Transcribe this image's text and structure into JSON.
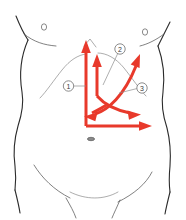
{
  "figure": {
    "background_color": "#ffffff",
    "outline_color": "#2b2b2b",
    "arrow_color": "#e8392b",
    "label_color": "#3a3a3a",
    "width": 186,
    "height": 220
  },
  "callouts": [
    {
      "id": "callout-1",
      "label": "①",
      "number": "1",
      "cx": 68.5,
      "cy": 86,
      "r": 5.2,
      "leader": "M 73.7 86 L 86 86"
    },
    {
      "id": "callout-2",
      "label": "②",
      "number": "2",
      "cx": 120,
      "cy": 49,
      "r": 5.2,
      "leader": "M 117.5 54 L 102 84"
    },
    {
      "id": "callout-3",
      "label": "③",
      "number": "3",
      "cx": 142,
      "cy": 88,
      "r": 5.2,
      "leader": "M 136.9 88.5 L 118 94"
    }
  ],
  "arrows": [
    {
      "id": "arrow-epigastric-up-tall",
      "direction": "up",
      "description": "tall vertical arrow rising to xiphoid",
      "width": 3.0
    },
    {
      "id": "arrow-epigastric-up-short",
      "direction": "up",
      "description": "short vertical arrow beside the tall one",
      "width": 3.0
    },
    {
      "id": "arrow-lower-right-horizontal",
      "direction": "right",
      "description": "horizontal arrow running right along lower abdomen",
      "width": 3.0
    },
    {
      "id": "arrow-diagonal-down-right",
      "direction": "down-right",
      "description": "diagonal arrow sweeping down to the right flank",
      "width": 3.0
    },
    {
      "id": "arrow-diagonal-down-left",
      "direction": "down-left",
      "description": "diagonal arrow sweeping down to the left flank",
      "width": 3.0
    },
    {
      "id": "arrow-curve-up-right",
      "direction": "up-right",
      "description": "curved arrow sweeping up toward the right upper quadrant",
      "width": 3.0
    }
  ],
  "anatomy_marks": [
    {
      "id": "nipple-left",
      "type": "nipple-mark",
      "cx": 44,
      "cy": 27
    },
    {
      "id": "nipple-right",
      "type": "nipple-mark",
      "cx": 145,
      "cy": 32
    },
    {
      "id": "navel",
      "type": "navel-mark",
      "cx": 91,
      "cy": 139
    }
  ]
}
